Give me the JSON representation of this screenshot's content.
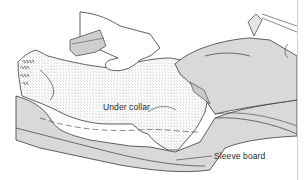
{
  "figure": {
    "type": "technical-illustration",
    "labels": {
      "under_collar": "Under collar",
      "sleeve_board": "Sleeve board"
    },
    "parts": [
      "hand",
      "under-collar",
      "iron",
      "sleeve-board"
    ],
    "colors": {
      "line": "#3a3a3a",
      "shade": "#d9d9d9",
      "fabric_dots": "#8a8a8a",
      "background": "#ffffff",
      "frame_edge": "#d0d0d0"
    }
  }
}
